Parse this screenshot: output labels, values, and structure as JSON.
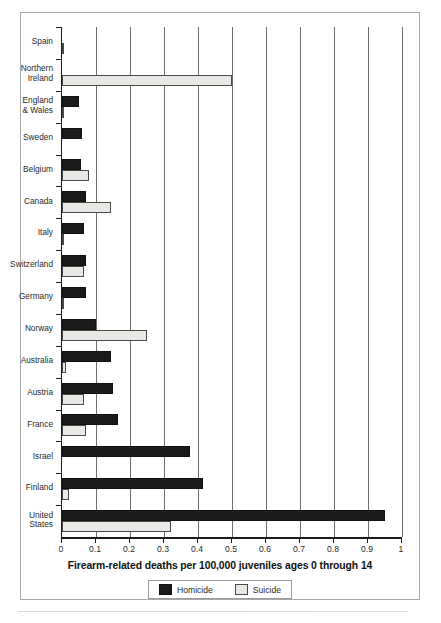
{
  "chart_data": {
    "type": "bar",
    "orientation": "horizontal",
    "title": "",
    "xlabel": "Firearm-related deaths per 100,000 juveniles ages 0 through 14",
    "ylabel": "",
    "xlim": [
      0,
      1
    ],
    "xticks": [
      0,
      0.1,
      0.2,
      0.3,
      0.4,
      0.5,
      0.6,
      0.7,
      0.8,
      0.9,
      1
    ],
    "xticklabels": [
      "0",
      "0.1",
      "0.2",
      "0.3",
      "0.4",
      "0.5",
      "0.6",
      "0.7",
      "0.8",
      "0.9",
      "1"
    ],
    "grid": "vertical",
    "legend_position": "bottom-center",
    "categories": [
      "Spain",
      "Northern\nIreland",
      "England\n& Wales",
      "Sweden",
      "Belgium",
      "Canada",
      "Italy",
      "Switzerland",
      "Germany",
      "Norway",
      "Australia",
      "Austria",
      "France",
      "Israel",
      "Finland",
      "United\nStates"
    ],
    "series": [
      {
        "name": "Homicide",
        "color": "#1b1b1b",
        "values": [
          0.0,
          0.0,
          0.05,
          0.06,
          0.055,
          0.07,
          0.065,
          0.07,
          0.07,
          0.1,
          0.145,
          0.15,
          0.165,
          0.375,
          0.415,
          0.95
        ]
      },
      {
        "name": "Suicide",
        "color": "#e8e8e4",
        "values": [
          0.006,
          0.5,
          0.006,
          0.0,
          0.08,
          0.145,
          0.006,
          0.065,
          0.006,
          0.25,
          0.012,
          0.065,
          0.07,
          0.0,
          0.02,
          0.32
        ]
      }
    ]
  },
  "legend": {
    "items": [
      {
        "label": "Homicide",
        "swatch": "homicide"
      },
      {
        "label": "Suicide",
        "swatch": "suicide"
      }
    ]
  }
}
